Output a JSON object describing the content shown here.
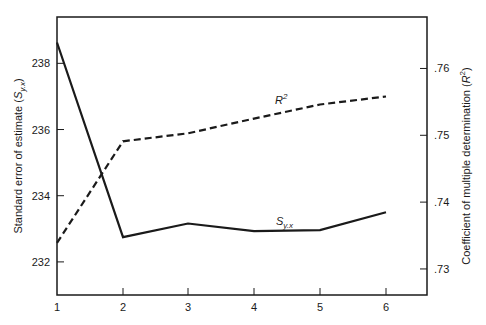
{
  "chart_data": {
    "type": "line",
    "title": "",
    "xlabel": "",
    "x": [
      1,
      2,
      3,
      4,
      5,
      6
    ],
    "x_tick_labels": [
      "1",
      "2",
      "3",
      "4",
      "5",
      "6"
    ],
    "y_left": {
      "label": "Standard error of estimate (S_y.x)",
      "label_main": "Standard error of estimate (",
      "label_symbol": "S",
      "label_sub": "y.x",
      "label_close": ")",
      "ticks": [
        232,
        234,
        236,
        238
      ],
      "tick_labels": [
        "232",
        "234",
        "236",
        "238"
      ],
      "range": [
        231.0,
        239.4
      ]
    },
    "y_right": {
      "label": "Coefficient of multiple determination (R^2)",
      "label_main": "Coefficient of multiple determination (",
      "label_symbol": "R",
      "label_sup": "2",
      "label_close": ")",
      "ticks": [
        0.73,
        0.74,
        0.75,
        0.76
      ],
      "tick_labels": [
        ".73",
        ".74",
        ".75",
        ".76"
      ],
      "range": [
        0.7261,
        0.7677
      ]
    },
    "series": [
      {
        "name": "S_y.x",
        "label_symbol": "S",
        "label_sub": "y.x",
        "axis": "left",
        "style": "solid",
        "values": [
          238.63,
          232.75,
          233.16,
          232.93,
          232.96,
          233.5
        ]
      },
      {
        "name": "R^2",
        "label_symbol": "R",
        "label_sup": "2",
        "axis": "right",
        "style": "dashed",
        "values": [
          0.7339,
          0.7491,
          0.7503,
          0.7525,
          0.7546,
          0.7558
        ]
      }
    ],
    "grid": false,
    "legend": "inline labels on lines"
  },
  "colors": {
    "line": "#1a1a1a",
    "frame": "#1a1a1a",
    "background": "#ffffff"
  }
}
